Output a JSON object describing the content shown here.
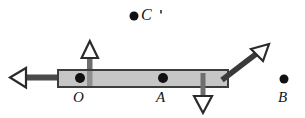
{
  "figure": {
    "type": "physics-force-diagram",
    "background_color": "#ffffff",
    "width": 305,
    "height": 118,
    "bar": {
      "name": "rigid-bar",
      "fill_color": "#c6c6c6",
      "stroke_color": "#3d3d3d",
      "x": 58,
      "y": 70,
      "width": 170,
      "height": 17
    },
    "points": [
      {
        "id": "O",
        "label": "O",
        "dot_x": 80,
        "dot_y": 78,
        "label_x": 73,
        "label_y": 90,
        "dot_radius": 5.0,
        "on_bar": true
      },
      {
        "id": "A",
        "label": "A",
        "dot_x": 163,
        "dot_y": 78,
        "label_x": 156,
        "label_y": 90,
        "dot_radius": 5.0,
        "on_bar": true
      },
      {
        "id": "B",
        "label": "B",
        "dot_x": 284,
        "dot_y": 79,
        "label_x": 278,
        "label_y": 91,
        "dot_radius": 4.5,
        "on_bar": false
      },
      {
        "id": "C",
        "label": "C",
        "dot_x": 134,
        "dot_y": 16,
        "label_x": 141,
        "label_y": 8,
        "dot_radius": 4.5,
        "on_bar": false
      }
    ],
    "tick_mark": {
      "name": "c-tick-mark",
      "x": 160,
      "y": 10,
      "width": 2,
      "height": 3,
      "color": "#555555"
    },
    "arrows": [
      {
        "id": "left-arrow",
        "direction": "left",
        "shaft_color": "#4a4a4a",
        "head_fill": "#ffffff",
        "head_stroke": "#2b2b2b",
        "tail_x": 60,
        "tail_y": 78,
        "tip_x": 10,
        "tip_y": 78
      },
      {
        "id": "up-arrow",
        "direction": "up",
        "shaft_color": "#6e6e6e",
        "head_fill": "#ffffff",
        "head_stroke": "#2b2b2b",
        "tail_x": 90,
        "tail_y": 85,
        "tip_x": 90,
        "tip_y": 41
      },
      {
        "id": "down-arrow",
        "direction": "down",
        "shaft_color": "#6e6e6e",
        "head_fill": "#ffffff",
        "head_stroke": "#2b2b2b",
        "tail_x": 203,
        "tail_y": 73,
        "tip_x": 203,
        "tip_y": 113
      },
      {
        "id": "diagonal-arrow",
        "direction": "up-right",
        "shaft_color": "#3a3a3a",
        "head_fill": "#ffffff",
        "head_stroke": "#2b2b2b",
        "tail_x": 224,
        "tail_y": 80,
        "tip_x": 268,
        "tip_y": 45
      }
    ]
  }
}
